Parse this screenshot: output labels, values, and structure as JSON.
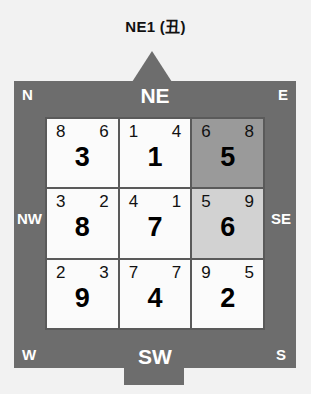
{
  "title": "NE1 (丑)",
  "colors": {
    "frame": "#6d6d6d",
    "grid_line": "#5a5a5a",
    "cell": "#fbfbfb",
    "shade_dark": "#9a9a9a",
    "shade_light": "#d2d2d2",
    "label": "#ffffff",
    "text": "#000000"
  },
  "compass": {
    "facing_label": "NE",
    "sitting_label": "SW",
    "labels": {
      "n": "N",
      "ne": "NE",
      "e": "E",
      "nw": "NW",
      "se": "SE",
      "w": "W",
      "sw": "SW",
      "s": "S"
    }
  },
  "grid": {
    "cells": [
      {
        "position": "n",
        "mountain_star": "8",
        "water_star": "6",
        "period_star": "3",
        "shade": "none"
      },
      {
        "position": "ne",
        "mountain_star": "1",
        "water_star": "4",
        "period_star": "1",
        "shade": "none"
      },
      {
        "position": "e",
        "mountain_star": "6",
        "water_star": "8",
        "period_star": "5",
        "shade": "dark"
      },
      {
        "position": "nw",
        "mountain_star": "3",
        "water_star": "2",
        "period_star": "8",
        "shade": "none"
      },
      {
        "position": "center",
        "mountain_star": "4",
        "water_star": "1",
        "period_star": "7",
        "shade": "none"
      },
      {
        "position": "se",
        "mountain_star": "5",
        "water_star": "9",
        "period_star": "6",
        "shade": "light"
      },
      {
        "position": "w",
        "mountain_star": "2",
        "water_star": "3",
        "period_star": "9",
        "shade": "none"
      },
      {
        "position": "sw",
        "mountain_star": "7",
        "water_star": "7",
        "period_star": "4",
        "shade": "none"
      },
      {
        "position": "s",
        "mountain_star": "9",
        "water_star": "5",
        "period_star": "2",
        "shade": "none"
      }
    ]
  }
}
